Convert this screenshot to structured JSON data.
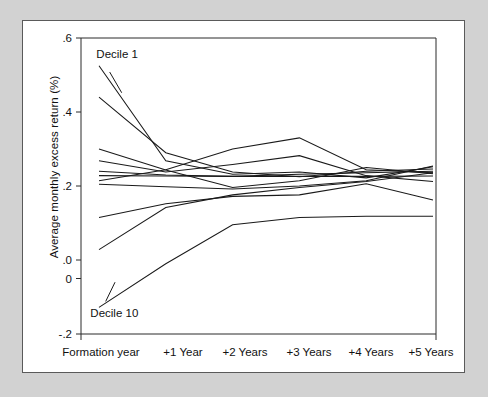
{
  "figure": {
    "background_color": "#d2d2d2",
    "panel_color": "#ffffff",
    "panel_border_color": "#5a5a5a",
    "line_color": "#1a1a1a"
  },
  "annotations": {
    "decile1_label": "Decile 1",
    "decile10_label": "Decile 10"
  },
  "chart_data": {
    "type": "line",
    "title": "",
    "subtitle": "",
    "xlabel": "",
    "ylabel": "Average monthly excess return (%)",
    "categories": [
      "Formation year",
      "+1 Year",
      "+2 Years",
      "+3 Years",
      "+4 Years",
      "+5 Years"
    ],
    "x": [
      0,
      1,
      2,
      3,
      4,
      5
    ],
    "xtick_labels": [
      "Formation year",
      "+1 Year",
      "+2 Years",
      "+3 Years",
      "+4 Years",
      "+5 Years"
    ],
    "ytick_labels": [
      ".6",
      ".4",
      ".2",
      ".0",
      "0",
      "-.2"
    ],
    "ytick_values": [
      0.6,
      0.4,
      0.2,
      0.0,
      -0.05,
      -0.2
    ],
    "ylim": [
      -0.2,
      0.6
    ],
    "xlim": [
      -0.22,
      5.35
    ],
    "grid": false,
    "legend": "none",
    "legend_position": "none",
    "annotations": [
      {
        "text": "Decile 1",
        "x": 0.08,
        "y": 0.545,
        "note": "label with leader line to the top series"
      },
      {
        "text": "Decile 10",
        "x": 0.02,
        "y": -0.155,
        "note": "label with leader line to the bottom series"
      }
    ],
    "series": [
      {
        "name": "Decile 1",
        "values": [
          0.525,
          0.268,
          0.232,
          0.238,
          0.222,
          0.252
        ]
      },
      {
        "name": "Decile 2",
        "values": [
          0.44,
          0.29,
          0.238,
          0.225,
          0.24,
          0.246
        ]
      },
      {
        "name": "Decile 3",
        "values": [
          0.3,
          0.243,
          0.196,
          0.214,
          0.25,
          0.233
        ]
      },
      {
        "name": "Decile 4",
        "values": [
          0.268,
          0.238,
          0.258,
          0.282,
          0.228,
          0.212
        ]
      },
      {
        "name": "Decile 5",
        "values": [
          0.24,
          0.23,
          0.226,
          0.232,
          0.236,
          0.24
        ]
      },
      {
        "name": "Decile 6",
        "values": [
          0.228,
          0.227,
          0.226,
          0.226,
          0.226,
          0.227
        ]
      },
      {
        "name": "Decile 7",
        "values": [
          0.214,
          0.244,
          0.3,
          0.33,
          0.244,
          0.236
        ]
      },
      {
        "name": "Decile 8",
        "values": [
          0.205,
          0.198,
          0.192,
          0.2,
          0.214,
          0.254
        ]
      },
      {
        "name": "Decile 9",
        "values": [
          0.115,
          0.152,
          0.172,
          0.176,
          0.206,
          0.162
        ]
      },
      {
        "name": "Decile 10",
        "values": [
          0.028,
          0.142,
          0.176,
          0.196,
          0.212,
          0.236
        ]
      },
      {
        "name": "Decile 10 lower",
        "values": [
          -0.128,
          -0.01,
          0.095,
          0.115,
          0.118,
          0.118
        ]
      }
    ]
  }
}
